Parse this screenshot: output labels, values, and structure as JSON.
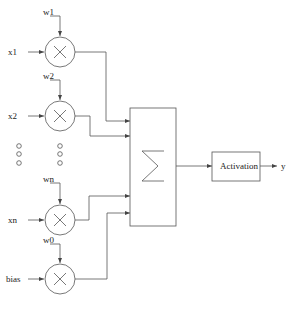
{
  "diagram": {
    "type": "neuron-perceptron",
    "inputs": [
      {
        "input_label": "x1",
        "weight_label": "w1",
        "cy": 52
      },
      {
        "input_label": "x2",
        "weight_label": "w2",
        "cy": 116
      },
      {
        "input_label": "xn",
        "weight_label": "wn",
        "cy": 220
      },
      {
        "input_label": "bias",
        "weight_label": "w0",
        "cy": 279
      }
    ],
    "ellipsis": "○ ○ ○",
    "summation": {
      "symbol": "sigma",
      "label": "Σ"
    },
    "activation": {
      "label": "Activation"
    },
    "output": {
      "label": "y"
    },
    "colors": {
      "stroke": "#555555",
      "text": "#222222",
      "background": "#ffffff"
    }
  }
}
